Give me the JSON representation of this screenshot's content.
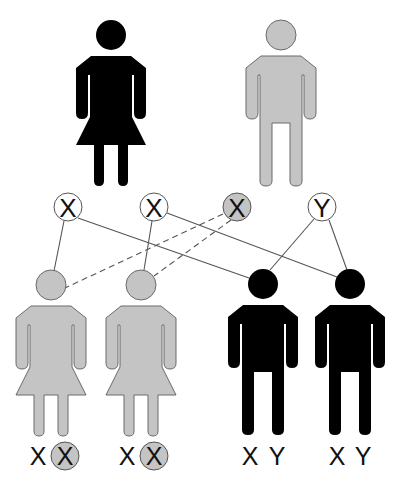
{
  "colors": {
    "affected": "#000000",
    "carrier_gray": "#c4c4c4",
    "gray_outline": "#6a6a6a",
    "line": "#555555",
    "background": "#ffffff"
  },
  "parents": {
    "mother": {
      "sex": "female",
      "fill": "black",
      "status": "affected"
    },
    "father": {
      "sex": "male",
      "fill": "gray",
      "status": "unaffected"
    }
  },
  "gametes": [
    {
      "id": "x1",
      "label": "X",
      "highlighted": false,
      "source": "mother"
    },
    {
      "id": "x2",
      "label": "X",
      "highlighted": false,
      "source": "mother"
    },
    {
      "id": "x3",
      "label": "X",
      "highlighted": true,
      "source": "father"
    },
    {
      "id": "y1",
      "label": "Y",
      "highlighted": false,
      "source": "father"
    }
  ],
  "connections": [
    {
      "from": "x1",
      "to": "daughter1",
      "style": "solid"
    },
    {
      "from": "x1",
      "to": "son1",
      "style": "solid"
    },
    {
      "from": "x2",
      "to": "daughter2",
      "style": "solid"
    },
    {
      "from": "x2",
      "to": "son2",
      "style": "solid"
    },
    {
      "from": "x3",
      "to": "daughter1",
      "style": "dashed"
    },
    {
      "from": "x3",
      "to": "daughter2",
      "style": "dashed"
    },
    {
      "from": "y1",
      "to": "son1",
      "style": "solid"
    },
    {
      "from": "y1",
      "to": "son2",
      "style": "solid"
    }
  ],
  "children": [
    {
      "id": "daughter1",
      "sex": "female",
      "fill": "gray",
      "genotype": [
        "X",
        "X"
      ],
      "highlighted_allele": 1
    },
    {
      "id": "daughter2",
      "sex": "female",
      "fill": "gray",
      "genotype": [
        "X",
        "X"
      ],
      "highlighted_allele": 1
    },
    {
      "id": "son1",
      "sex": "male",
      "fill": "black",
      "genotype": [
        "X",
        "Y"
      ],
      "highlighted_allele": null
    },
    {
      "id": "son2",
      "sex": "male",
      "fill": "black",
      "genotype": [
        "X",
        "Y"
      ],
      "highlighted_allele": null
    }
  ],
  "labels": {
    "gamete_x1": "X",
    "gamete_x2": "X",
    "gamete_x3": "X",
    "gamete_y1": "Y",
    "d1_a": "X",
    "d1_b": "X",
    "d2_a": "X",
    "d2_b": "X",
    "s1_a": "X",
    "s1_b": "Y",
    "s2_a": "X",
    "s2_b": "Y"
  }
}
